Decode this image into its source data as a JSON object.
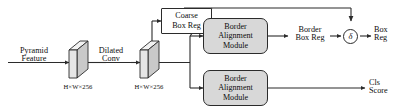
{
  "diagram": {
    "type": "neural-network-architecture",
    "inputs": [
      {
        "id": "pyramid_feature",
        "line1": "Pyramid",
        "line2": "Feature"
      }
    ],
    "operations": [
      {
        "id": "dilated_conv",
        "line1": "Dilated",
        "line2": "Conv"
      }
    ],
    "tensors": [
      {
        "id": "tensor_1",
        "shape": "H×W×256"
      },
      {
        "id": "tensor_2",
        "shape": "H×W×256"
      }
    ],
    "blocks": [
      {
        "id": "coarse_box_reg",
        "shape": "rect",
        "line1": "Coarse",
        "line2": "Box Reg"
      },
      {
        "id": "border_alignment_module_top",
        "shape": "rounded",
        "line1": "Border",
        "line2": "Alignment",
        "line3": "Module"
      },
      {
        "id": "border_alignment_module_bottom",
        "shape": "rounded",
        "line1": "Border",
        "line2": "Alignment",
        "line3": "Module"
      }
    ],
    "nodes": [
      {
        "id": "delta_node",
        "symbol": "δ"
      }
    ],
    "intermediates": [
      {
        "id": "border_box_reg",
        "line1": "Border",
        "line2": "Box Reg"
      }
    ],
    "outputs": [
      {
        "id": "box_reg_output",
        "line1": "Box",
        "line2": "Reg"
      },
      {
        "id": "cls_score_output",
        "line1": "Cls",
        "line2": "Score"
      }
    ],
    "colors": {
      "stroke": "#2b2b2b",
      "module_fill": "#d8d8d8",
      "cube_face": "#e3e3e3",
      "cube_top": "#f2f2f2",
      "cube_side": "#c9c9c9",
      "background": "#ffffff",
      "text": "#0d0d0d"
    }
  }
}
